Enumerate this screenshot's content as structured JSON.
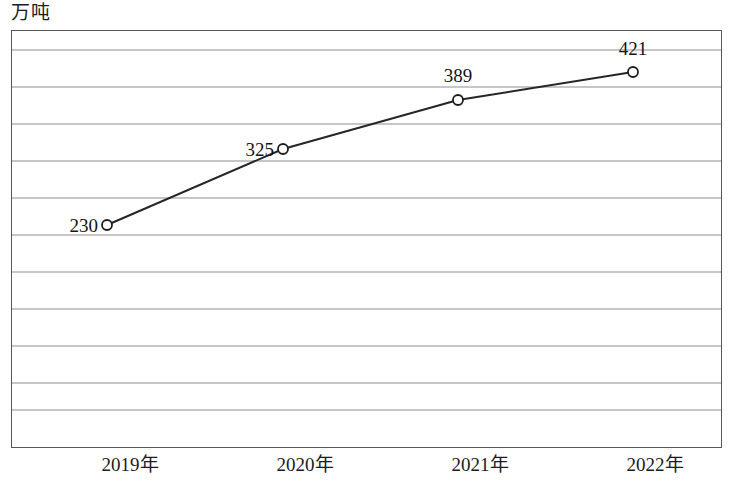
{
  "axis": {
    "y_unit_label": "万吨"
  },
  "chart_data": {
    "type": "line",
    "title": "",
    "subtitle": "",
    "xlabel": "",
    "ylabel": "万吨",
    "categories": [
      "2019年",
      "2020年",
      "2021年",
      "2022年"
    ],
    "values": [
      230,
      325,
      389,
      421
    ],
    "data_labels": [
      "230",
      "325",
      "389",
      "421"
    ],
    "series": [
      {
        "name": "",
        "values": [
          230,
          325,
          389,
          421
        ]
      }
    ],
    "grid": {
      "horizontal": true,
      "vertical": false,
      "line_count": 10
    },
    "legend": {
      "visible": false,
      "position": "none"
    },
    "marker": {
      "shape": "open-circle",
      "fill": "#ffffff",
      "stroke": "#1e1e1e"
    },
    "colors": {
      "line": "#26262a",
      "gridline": "#8d8d92",
      "frame": "#58585c",
      "text": "#1c1c1c"
    },
    "ylim": [
      0,
      462
    ],
    "axis_ticks_visible": false,
    "annotations": [
      {
        "label": "230",
        "position": "left-of-marker"
      },
      {
        "label": "325",
        "position": "left-of-marker"
      },
      {
        "label": "389",
        "position": "above-marker"
      },
      {
        "label": "421",
        "position": "above-marker"
      }
    ]
  },
  "geometry": {
    "frame": {
      "x": 11,
      "y": 30,
      "w": 711,
      "h": 418
    },
    "gridlines_y": [
      50,
      87,
      124,
      161,
      198,
      235,
      272,
      309,
      346,
      383,
      410
    ],
    "points": [
      {
        "x": 107,
        "y": 225
      },
      {
        "x": 283,
        "y": 149
      },
      {
        "x": 458,
        "y": 100
      },
      {
        "x": 633,
        "y": 72
      }
    ],
    "x_label_positions": [
      130,
      305,
      480,
      655
    ],
    "value_label_positions": [
      {
        "x": 98,
        "y": 226,
        "mode": "left-of"
      },
      {
        "x": 274,
        "y": 150,
        "mode": "left-of"
      },
      {
        "x": 458,
        "y": 87,
        "mode": "above"
      },
      {
        "x": 633,
        "y": 60,
        "mode": "above"
      }
    ]
  }
}
